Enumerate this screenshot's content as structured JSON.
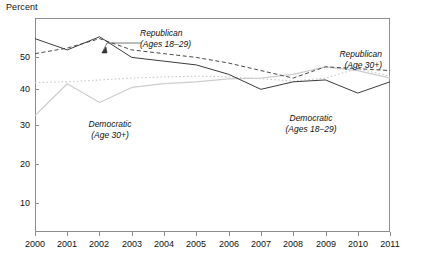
{
  "chart_data": {
    "type": "line",
    "title": "",
    "ylabel": "Percent",
    "xlabel": "",
    "ylim": [
      0,
      57
    ],
    "yticks": [
      10,
      20,
      30,
      40,
      50
    ],
    "grid": false,
    "legend_position": "inline-annotations",
    "x": [
      2000,
      2001,
      2002,
      2003,
      2004,
      2005,
      2006,
      2007,
      2008,
      2009,
      2010,
      2011
    ],
    "categories": [
      "2000",
      "2001",
      "2002",
      "2003",
      "2004",
      "2005",
      "2006",
      "2007",
      "2008",
      "2009",
      "2010",
      "2011"
    ],
    "series": [
      {
        "name": "Republican (Ages 18-29)",
        "style": "solid",
        "color": "#3c3c3c",
        "values": [
          51.5,
          48.5,
          52.0,
          46.5,
          45.5,
          44.5,
          42.0,
          38.0,
          40.0,
          40.5,
          37.0,
          40.0
        ]
      },
      {
        "name": "Republican (Age 30+)",
        "style": "dashed",
        "color": "#4a4a4a",
        "values": [
          47.5,
          49.0,
          51.5,
          48.5,
          47.5,
          46.5,
          45.0,
          43.0,
          41.0,
          44.0,
          43.5,
          43.0
        ]
      },
      {
        "name": "Democratic (Age 30+)",
        "style": "dotted",
        "color": "#c9c9c9",
        "values": [
          39.8,
          40.0,
          40.5,
          41.0,
          41.3,
          41.5,
          41.3,
          40.8,
          40.2,
          41.0,
          43.5,
          41.5
        ]
      },
      {
        "name": "Democratic (Ages 18-29)",
        "style": "solid",
        "color": "#cdcdcd",
        "values": [
          31.0,
          39.5,
          34.5,
          38.5,
          39.5,
          40.0,
          40.8,
          41.0,
          42.0,
          44.0,
          43.0,
          41.0
        ]
      }
    ],
    "annotations": [
      {
        "id": "republican-young",
        "line1": "Republican",
        "line2": "(Ages 18–29)",
        "has_leader": true
      },
      {
        "id": "republican-old",
        "line1": "Republican",
        "line2": "(Age 30+)",
        "has_leader": false
      },
      {
        "id": "democratic-old",
        "line1": "Democratic",
        "line2": "(Age 30+)",
        "has_leader": false
      },
      {
        "id": "democratic-young",
        "line1": "Democratic",
        "line2": "(Ages 18–29)",
        "has_leader": false
      }
    ]
  },
  "axis": {
    "y_title": "Percent",
    "yticks": [
      "50",
      "40",
      "30",
      "20",
      "10"
    ],
    "xticks": [
      "2000",
      "2001",
      "2002",
      "2003",
      "2004",
      "2005",
      "2006",
      "2007",
      "2008",
      "2009",
      "2010",
      "2011"
    ]
  }
}
